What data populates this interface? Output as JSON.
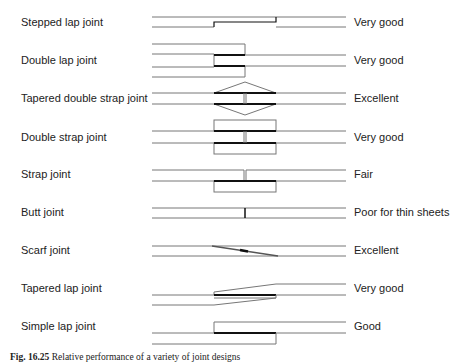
{
  "rows": [
    {
      "name": "Stepped lap joint",
      "rating": "Very good"
    },
    {
      "name": "Double lap joint",
      "rating": "Very good"
    },
    {
      "name": "Tapered double strap joint",
      "rating": "Excellent"
    },
    {
      "name": "Double strap joint",
      "rating": "Very good"
    },
    {
      "name": "Strap joint",
      "rating": "Fair"
    },
    {
      "name": "Butt joint",
      "rating": "Poor for thin sheets"
    },
    {
      "name": "Scarf joint",
      "rating": "Excellent"
    },
    {
      "name": "Tapered lap joint",
      "rating": "Very good"
    },
    {
      "name": "Simple lap joint",
      "rating": "Good"
    }
  ],
  "caption": {
    "label": "Fig. 16.25",
    "text": "Relative performance of a variety of joint designs"
  },
  "colors": {
    "line": "#777777",
    "adhesive": "#111111"
  }
}
